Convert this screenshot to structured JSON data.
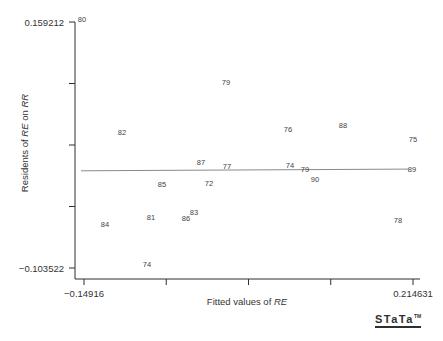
{
  "figure": {
    "background": "#ffffff",
    "text_color": "#3a3a3a",
    "axis_color": "#2f2f2f",
    "fit_line_color": "#8a8a8a",
    "stata_logo_text": "STaTa",
    "stata_logo_tm": "TM"
  },
  "chart_data": {
    "type": "scatter",
    "title": "",
    "ylabel": "Residents of RE on RR",
    "xlabel": "Fitted values of RE",
    "ylabel_parts": [
      {
        "text": "Residents of ",
        "italic": false
      },
      {
        "text": "RE",
        "italic": true
      },
      {
        "text": " on ",
        "italic": false
      },
      {
        "text": "RR",
        "italic": true
      }
    ],
    "xlabel_parts": [
      {
        "text": "Fitted values of ",
        "italic": false
      },
      {
        "text": "RE",
        "italic": true
      }
    ],
    "xlim": [
      -0.14916,
      0.214631
    ],
    "ylim": [
      -0.103522,
      0.159212
    ],
    "grid": false,
    "legend": null,
    "x_ticks": [
      {
        "value": -0.14916,
        "label": "−0.14916"
      },
      {
        "value": -0.05821226,
        "label": ""
      },
      {
        "value": 0.03273547,
        "label": ""
      },
      {
        "value": 0.12368321,
        "label": ""
      },
      {
        "value": 0.214631,
        "label": "0.214631"
      }
    ],
    "y_ticks": [
      {
        "value": 0.159212,
        "label": "0.159212"
      },
      {
        "value": 0.0935285,
        "label": ""
      },
      {
        "value": 0.027845,
        "label": ""
      },
      {
        "value": -0.0378385,
        "label": ""
      },
      {
        "value": -0.103522,
        "label": "−0.103522"
      }
    ],
    "points": [
      {
        "label": "80",
        "x": -0.1514,
        "y": 0.1613
      },
      {
        "label": "79",
        "x": 0.0078,
        "y": 0.0941
      },
      {
        "label": "82",
        "x": -0.1071,
        "y": 0.0407
      },
      {
        "label": "76",
        "x": 0.0764,
        "y": 0.0439
      },
      {
        "label": "88",
        "x": 0.1372,
        "y": 0.0481
      },
      {
        "label": "75",
        "x": 0.2146,
        "y": 0.0332
      },
      {
        "label": "87",
        "x": -0.0198,
        "y": 0.0086
      },
      {
        "label": "77",
        "x": 0.009,
        "y": 0.0043
      },
      {
        "label": "74",
        "x": 0.0786,
        "y": 0.0054
      },
      {
        "label": "79",
        "x": 0.0952,
        "y": 0.0011
      },
      {
        "label": "89",
        "x": 0.2135,
        "y": 0.0016
      },
      {
        "label": "90",
        "x": 0.1062,
        "y": -0.0095
      },
      {
        "label": "85",
        "x": -0.0629,
        "y": -0.0149
      },
      {
        "label": "72",
        "x": -0.011,
        "y": -0.0138
      },
      {
        "label": "81",
        "x": -0.0751,
        "y": -0.0501
      },
      {
        "label": "83",
        "x": -0.0276,
        "y": -0.0448
      },
      {
        "label": "86",
        "x": -0.0364,
        "y": -0.0512
      },
      {
        "label": "84",
        "x": -0.126,
        "y": -0.0576
      },
      {
        "label": "78",
        "x": 0.198,
        "y": -0.0533
      },
      {
        "label": "74",
        "x": -0.0795,
        "y": -0.1003
      }
    ],
    "fit_line": {
      "x1": -0.1525,
      "y1": 0.0003,
      "x2": 0.2102,
      "y2": 0.0021
    }
  }
}
